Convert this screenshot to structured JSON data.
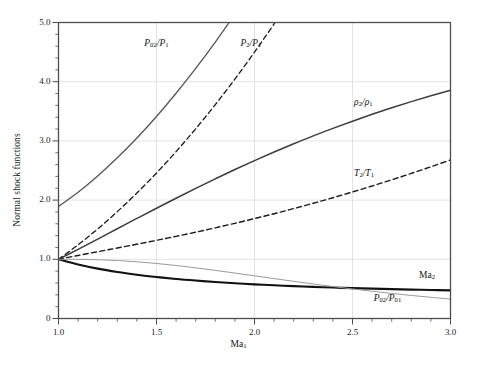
{
  "figure": {
    "background": "#ffffff",
    "frame_color": "#4d4d4d",
    "grid_color": "#dcdcdc"
  },
  "axes": {
    "ylabel": "Normal shock functions",
    "xlabel_text": "Ma",
    "xlabel_sub": "1",
    "x_ticks": [
      "1.0",
      "1.5",
      "2.0",
      "2.5",
      "3.0"
    ],
    "x_tick_values": [
      1.0,
      1.5,
      2.0,
      2.5,
      3.0
    ],
    "y_ticks": [
      "0",
      "1.0",
      "2.0",
      "3.0",
      "4.0",
      "5.0"
    ],
    "y_tick_values": [
      0,
      1,
      2,
      3,
      4,
      5
    ],
    "xlim": [
      1.0,
      3.0
    ],
    "ylim": [
      0,
      5
    ],
    "x_minor_per_major": 5,
    "y_minor_per_major": 5,
    "grid": "major gridlines on both axes, light gray"
  },
  "curve_labels": {
    "p02_p1": {
      "num": "P",
      "num_sub": "02",
      "den": "P",
      "den_sub": "1"
    },
    "p2_p1": {
      "num": "P",
      "num_sub": "2",
      "den": "P",
      "den_sub": "1"
    },
    "rho2_rho1": {
      "num": "ρ",
      "num_sub": "2",
      "den": "ρ",
      "den_sub": "1"
    },
    "t2_t1": {
      "num": "T",
      "num_sub": "2",
      "den": "T",
      "den_sub": "1"
    },
    "ma2": {
      "num": "Ma",
      "num_sub": "2"
    },
    "p02_p01": {
      "num": "P",
      "num_sub": "02",
      "den": "P",
      "den_sub": "01"
    }
  },
  "chart_data": {
    "type": "line",
    "title": "",
    "xlabel": "Ma₁",
    "ylabel": "Normal shock functions",
    "xlim": [
      1.0,
      3.0
    ],
    "ylim": [
      0.0,
      5.0
    ],
    "grid": true,
    "legend": "inline curve labels",
    "x": [
      1.0,
      1.1,
      1.2,
      1.3,
      1.4,
      1.5,
      1.6,
      1.7,
      1.8,
      1.9,
      2.0,
      2.1,
      2.2,
      2.3,
      2.4,
      2.5,
      2.6,
      2.7,
      2.8,
      2.9,
      3.0
    ],
    "series": [
      {
        "name": "P02/P1",
        "label": "P₀₂/P₁",
        "style": "solid",
        "color": "#555555",
        "width": 1.3,
        "values": [
          1.893,
          2.133,
          2.408,
          2.714,
          3.049,
          3.413,
          3.805,
          4.224,
          4.67,
          5.142,
          5.64,
          6.165,
          6.716,
          7.294,
          7.897,
          8.526,
          9.181,
          9.862,
          10.569,
          11.302,
          12.061
        ]
      },
      {
        "name": "P2/P1",
        "label": "P₂/P₁",
        "style": "dashed",
        "color": "#1a1a1a",
        "width": 1.3,
        "values": [
          1.0,
          1.245,
          1.513,
          1.805,
          2.12,
          2.458,
          2.82,
          3.205,
          3.613,
          4.045,
          4.5,
          4.978,
          5.48,
          6.005,
          6.553,
          7.125,
          7.72,
          8.338,
          8.98,
          9.645,
          10.333
        ]
      },
      {
        "name": "rho2/rho1",
        "label": "ρ₂/ρ₁",
        "style": "solid",
        "color": "#3d3d3d",
        "width": 1.5,
        "values": [
          1.0,
          1.169,
          1.342,
          1.516,
          1.69,
          1.862,
          2.032,
          2.198,
          2.359,
          2.516,
          2.667,
          2.812,
          2.951,
          3.085,
          3.212,
          3.333,
          3.449,
          3.559,
          3.664,
          3.763,
          3.857
        ]
      },
      {
        "name": "T2/T1",
        "label": "T₂/T₁",
        "style": "dashed",
        "color": "#1a1a1a",
        "width": 1.4,
        "values": [
          1.0,
          1.065,
          1.128,
          1.191,
          1.255,
          1.32,
          1.388,
          1.458,
          1.532,
          1.608,
          1.688,
          1.77,
          1.857,
          1.947,
          2.04,
          2.138,
          2.238,
          2.343,
          2.451,
          2.563,
          2.679
        ]
      },
      {
        "name": "Ma2",
        "label": "Ma₂",
        "style": "solid",
        "color": "#111111",
        "width": 2.1,
        "values": [
          1.0,
          0.912,
          0.842,
          0.786,
          0.74,
          0.701,
          0.668,
          0.641,
          0.617,
          0.596,
          0.577,
          0.561,
          0.547,
          0.534,
          0.523,
          0.513,
          0.504,
          0.496,
          0.488,
          0.481,
          0.475
        ]
      },
      {
        "name": "P02/P01",
        "label": "P₀₂/P₀₁",
        "style": "solid",
        "color": "#9a9a9a",
        "width": 1.0,
        "values": [
          1.0,
          0.9989,
          0.9928,
          0.9794,
          0.9582,
          0.9298,
          0.8952,
          0.8557,
          0.8127,
          0.7674,
          0.7209,
          0.6742,
          0.6281,
          0.5833,
          0.5401,
          0.499,
          0.4601,
          0.4236,
          0.3895,
          0.3577,
          0.3283
        ]
      }
    ],
    "annotations": [
      {
        "text": "P₀₂/P₁",
        "x": 1.55,
        "y": 4.62
      },
      {
        "text": "P₂/P₁",
        "x": 2.02,
        "y": 4.62
      },
      {
        "text": "ρ₂/ρ₁",
        "x": 2.6,
        "y": 3.62
      },
      {
        "text": "T₂/T₁",
        "x": 2.6,
        "y": 2.42
      },
      {
        "text": "Ma₂",
        "x": 2.88,
        "y": 0.7
      },
      {
        "text": "P₀₂/P₀₁",
        "x": 2.7,
        "y": 0.32
      }
    ]
  }
}
